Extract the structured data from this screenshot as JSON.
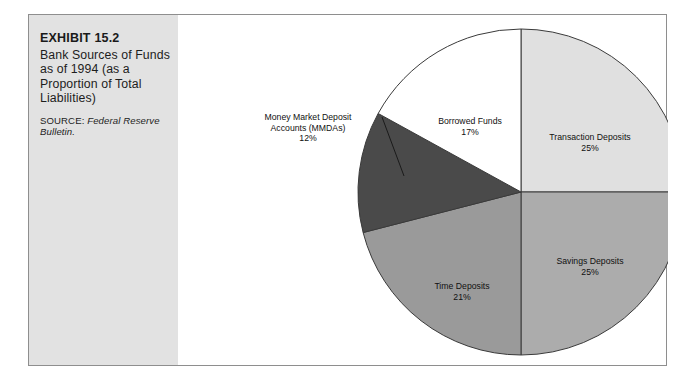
{
  "exhibit": {
    "number": "EXHIBIT 15.2",
    "title": "Bank Sources of Funds as of 1994 (as a Proportion of Total Liabilities)",
    "source_label": "SOURCE:",
    "source_reference": "Federal Reserve Bulletin."
  },
  "chart_data": {
    "type": "pie",
    "title": "Bank Sources of Funds as of 1994 (as a Proportion of Total Liabilities)",
    "unit": "percent",
    "legend": "none",
    "labels_position": "on-slice",
    "start_angle_deg": 0,
    "direction": "clockwise",
    "categories": [
      "Transaction Deposits",
      "Savings Deposits",
      "Time Deposits",
      "Money Market Deposit Accounts (MMDAs)",
      "Borrowed Funds"
    ],
    "values": [
      25,
      25,
      21,
      12,
      17
    ],
    "slices": [
      {
        "name": "Transaction Deposits",
        "value": 25,
        "value_text": "25%",
        "label_line1": "Transaction Deposits",
        "label_line2": "25%",
        "color": "#e0e0e0",
        "callout": false
      },
      {
        "name": "Savings Deposits",
        "value": 25,
        "value_text": "25%",
        "label_line1": "Savings Deposits",
        "label_line2": "25%",
        "color": "#acacac",
        "callout": false
      },
      {
        "name": "Time Deposits",
        "value": 21,
        "value_text": "21%",
        "label_line1": "Time Deposits",
        "label_line2": "21%",
        "color": "#9a9a9a",
        "callout": false
      },
      {
        "name": "Money Market Deposit Accounts (MMDAs)",
        "value": 12,
        "value_text": "12%",
        "label_line1": "Money Market Deposit",
        "label_line2": "Accounts (MMDAs)",
        "label_line3": "12%",
        "color": "#4a4a4a",
        "callout": true
      },
      {
        "name": "Borrowed Funds",
        "value": 17,
        "value_text": "17%",
        "label_line1": "Borrowed Funds",
        "label_line2": "17%",
        "color": "#ffffff",
        "callout": false
      }
    ],
    "colors": {
      "outline": "#3a3a3a",
      "panel_background": "#e2e2e2",
      "frame_border": "#8e8e8e",
      "chart_background": "#ffffff"
    }
  }
}
